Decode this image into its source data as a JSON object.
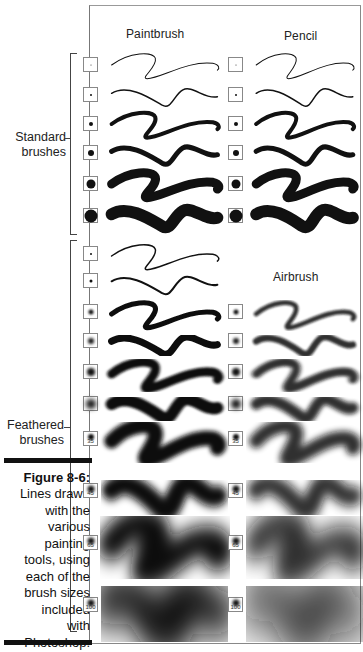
{
  "figure": {
    "number_label": "Figure 8-6:",
    "caption": "Lines drawn with the various painting tools, using each of the brush sizes included with Photoshop.",
    "caption_lines": [
      "Lines drawn",
      "with the",
      "various",
      "painting",
      "tools, using",
      "each of the",
      "brush sizes",
      "included",
      "with",
      "Photoshop."
    ]
  },
  "columns": {
    "paintbrush": "Paintbrush",
    "pencil": "Pencil",
    "airbrush": "Airbrush"
  },
  "groups": {
    "standard": [
      "Standard",
      "brushes"
    ],
    "feathered": [
      "Feathered",
      "brushes"
    ]
  },
  "brushes": {
    "standard": [
      {
        "size": 1
      },
      {
        "size": 3
      },
      {
        "size": 5
      },
      {
        "size": 9
      },
      {
        "size": 13
      },
      {
        "size": 19
      }
    ],
    "feathered": [
      {
        "size": 5,
        "label": ""
      },
      {
        "size": 9,
        "label": ""
      },
      {
        "size": 13,
        "label": ""
      },
      {
        "size": 17,
        "label": ""
      },
      {
        "size": 21,
        "label": ""
      },
      {
        "size": 27,
        "label": ""
      },
      {
        "size": 35,
        "label": "35"
      },
      {
        "size": 45,
        "label": "45"
      },
      {
        "size": 65,
        "label": "65"
      },
      {
        "size": 100,
        "label": "100"
      }
    ]
  },
  "colors": {
    "ink": "#111111",
    "frame": "#888888",
    "background": "#ffffff"
  }
}
